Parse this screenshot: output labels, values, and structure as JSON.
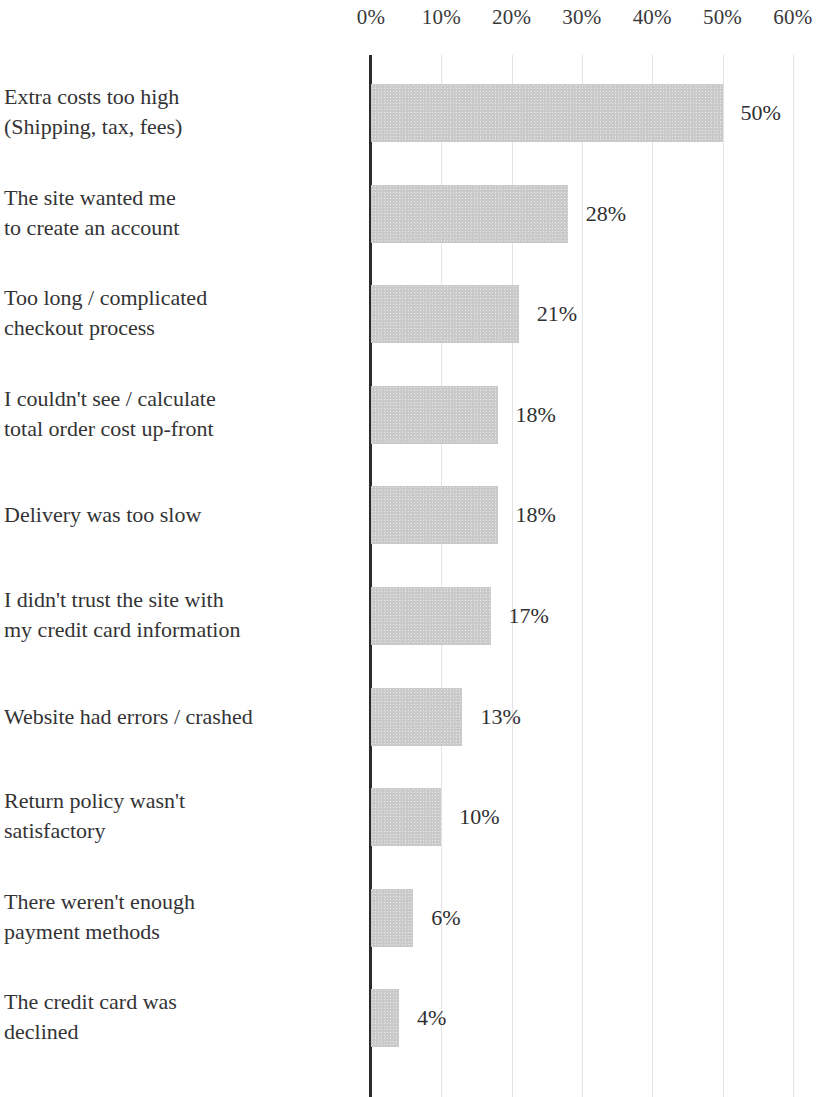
{
  "chart_data": {
    "type": "bar",
    "orientation": "horizontal",
    "title": "",
    "subtitle": "",
    "xlabel": "",
    "ylabel": "",
    "xlim": [
      0,
      60
    ],
    "x_tick_labels": [
      "0%",
      "10%",
      "20%",
      "30%",
      "40%",
      "50%",
      "60%"
    ],
    "x_ticks": [
      0,
      10,
      20,
      30,
      40,
      50,
      60
    ],
    "grid": "vertical",
    "legend": "none",
    "bar_color": "#c9c9c9",
    "axis_color": "#2b2b2d",
    "gridline_color": "#e3e3e5",
    "categories": [
      "Extra costs too high\n(Shipping, tax, fees)",
      "The site wanted me\nto create an account",
      "Too long / complicated\ncheckout process",
      "I couldn't see / calculate\ntotal order cost up-front",
      "Delivery was too slow",
      "I didn't trust the site with\nmy credit card information",
      "Website had errors / crashed",
      "Return policy wasn't\nsatisfactory",
      "There weren't enough\npayment methods",
      "The credit card was\ndeclined"
    ],
    "values": [
      50,
      28,
      21,
      18,
      18,
      17,
      13,
      10,
      6,
      4
    ],
    "value_labels": [
      "50%",
      "28%",
      "21%",
      "18%",
      "18%",
      "17%",
      "13%",
      "10%",
      "6%",
      "4%"
    ]
  }
}
